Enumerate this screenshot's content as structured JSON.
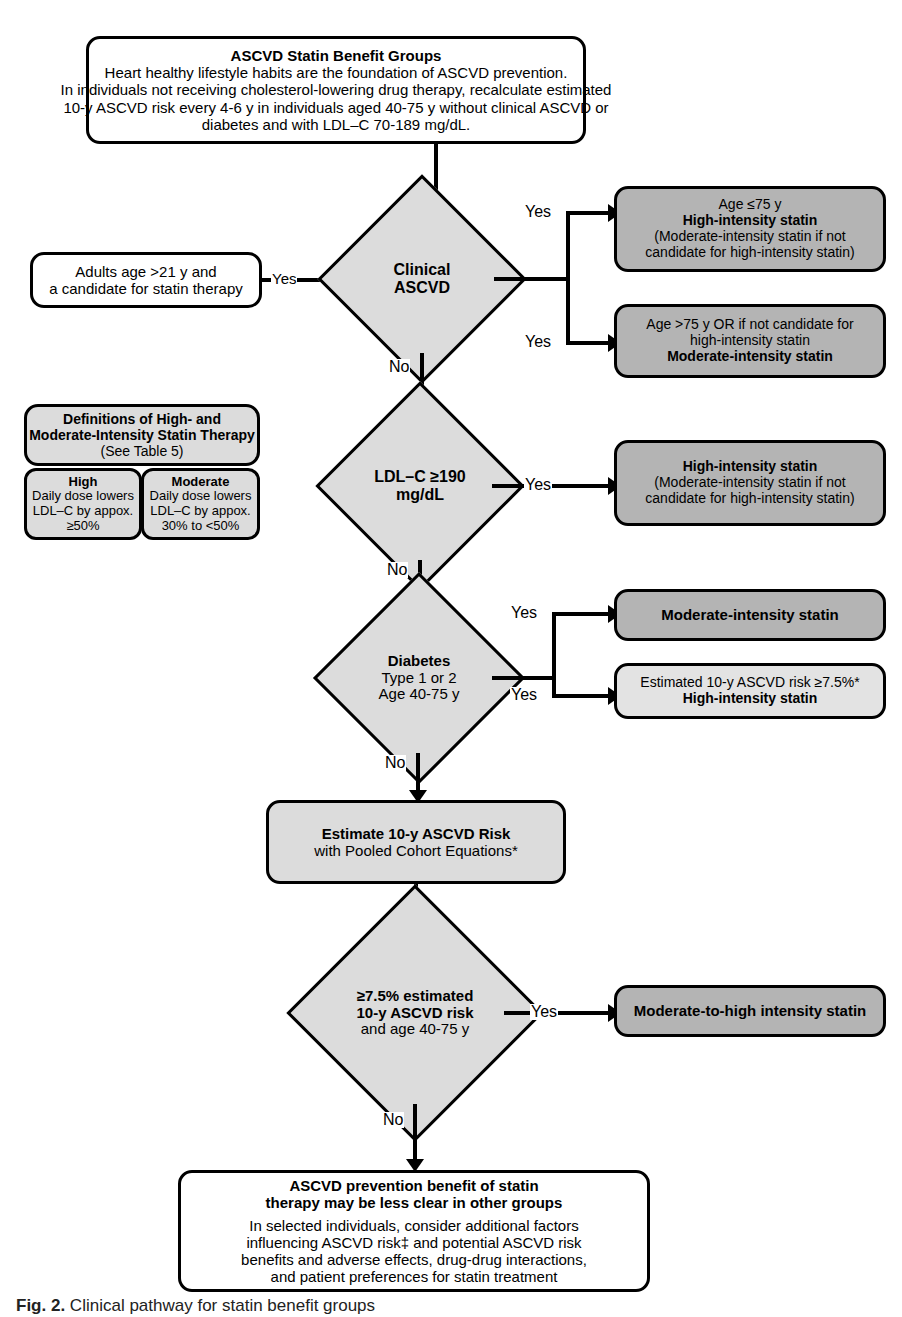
{
  "figure": {
    "caption_label": "Fig. 2.",
    "caption_text": "Clinical pathway for statin benefit groups"
  },
  "top_box": {
    "title": "ASCVD Statin Benefit Groups",
    "lines": [
      "Heart healthy lifestyle habits are the foundation of ASCVD prevention.",
      "In individuals not receiving cholesterol-lowering drug therapy, recalculate estimated",
      "10-y ASCVD risk every 4-6 y in individuals aged 40-75 y without clinical ASCVD or",
      "diabetes and with LDL–C 70-189 mg/dL."
    ]
  },
  "entry_box": {
    "lines": [
      "Adults age >21 y and",
      "a candidate for statin therapy"
    ]
  },
  "definitions": {
    "title_line1": "Definitions of High- and",
    "title_line2": "Moderate-Intensity Statin Therapy",
    "subtitle": "(See Table 5)",
    "columns": [
      {
        "header": "High",
        "lines": [
          "Daily dose lowers",
          "LDL–C by appox.",
          "≥50%"
        ]
      },
      {
        "header": "Moderate",
        "lines": [
          "Daily dose lowers",
          "LDL–C by appox.",
          "30% to <50%"
        ]
      }
    ]
  },
  "decisions": [
    {
      "id": "clinical-ascvd",
      "lines": [
        "Clinical",
        "ASCVD"
      ],
      "bold": [
        true,
        true
      ],
      "yes_label": "Yes",
      "no_label": "No"
    },
    {
      "id": "ldl-c-190",
      "lines": [
        "LDL–C ≥190",
        "mg/dL"
      ],
      "bold": [
        true,
        true
      ],
      "yes_label": "Yes",
      "no_label": "No"
    },
    {
      "id": "diabetes",
      "lines": [
        "Diabetes",
        "Type 1 or 2",
        "Age 40-75 y"
      ],
      "bold": [
        true,
        false,
        false
      ],
      "yes_label": "Yes",
      "no_label": "No"
    },
    {
      "id": "risk-7-5",
      "lines": [
        "≥7.5% estimated",
        "10-y ASCVD risk",
        "and age 40-75 y"
      ],
      "bold": [
        true,
        true,
        false
      ],
      "yes_label": "Yes",
      "no_label": "No"
    }
  ],
  "outcomes": {
    "ascvd_age_le75": {
      "lines": [
        "Age ≤75 y",
        "High-intensity statin",
        "(Moderate-intensity statin if not",
        "candidate for high-intensity statin)"
      ],
      "bold": [
        false,
        true,
        false,
        false
      ]
    },
    "ascvd_age_gt75": {
      "lines": [
        "Age >75 y OR if not candidate for",
        "high-intensity statin",
        "Moderate-intensity statin"
      ],
      "bold": [
        false,
        false,
        true
      ]
    },
    "ldl_high_intensity": {
      "lines": [
        "High-intensity statin",
        "(Moderate-intensity statin if not",
        "candidate for high-intensity statin)"
      ],
      "bold": [
        true,
        false,
        false
      ]
    },
    "diabetes_moderate": {
      "lines": [
        "Moderate-intensity statin"
      ],
      "bold": [
        true
      ]
    },
    "diabetes_risk_high": {
      "lines": [
        "Estimated 10-y ASCVD risk ≥7.5%*",
        "High-intensity statin"
      ],
      "bold": [
        false,
        true
      ]
    },
    "moderate_to_high": {
      "lines": [
        "Moderate-to-high intensity statin"
      ],
      "bold": [
        true
      ]
    }
  },
  "estimate_box": {
    "lines": [
      "Estimate 10-y ASCVD Risk",
      "with Pooled Cohort Equations*"
    ],
    "bold": [
      true,
      false
    ]
  },
  "final_box": {
    "title_line1": "ASCVD prevention benefit of statin",
    "title_line2": "therapy may be less clear in other groups",
    "lines": [
      "In selected individuals, consider additional factors",
      "influencing ASCVD risk‡ and potential ASCVD risk",
      "benefits and adverse effects, drug-drug interactions,",
      "and patient preferences for statin treatment"
    ]
  },
  "colors": {
    "fill_dark": "#b4b4b4",
    "fill_mid": "#dcdcdc",
    "fill_light": "#e3e3e3",
    "stroke": "#000000",
    "background": "#ffffff"
  }
}
